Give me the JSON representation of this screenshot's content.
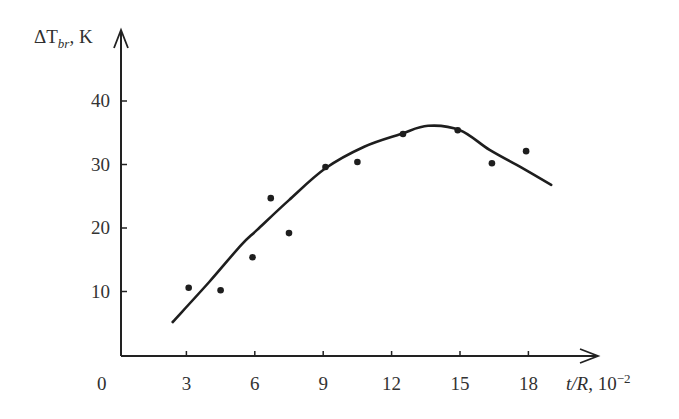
{
  "chart_data": {
    "type": "scatter",
    "title": "",
    "xlabel": "t/R, 10^-2",
    "ylabel": "ΔT_br, K",
    "xlim": [
      0,
      21
    ],
    "ylim": [
      0,
      45
    ],
    "grid": false,
    "legend": null,
    "x_ticks": [
      0,
      3,
      6,
      9,
      12,
      15,
      18
    ],
    "y_ticks": [
      10,
      20,
      30,
      40
    ],
    "series": [
      {
        "name": "measured",
        "kind": "scatter",
        "x": [
          3.1,
          4.5,
          5.9,
          6.7,
          7.5,
          9.1,
          10.5,
          12.5,
          14.9,
          16.4,
          17.9
        ],
        "y": [
          10.6,
          10.2,
          15.4,
          24.7,
          19.2,
          29.6,
          30.4,
          34.8,
          35.4,
          30.2,
          32.1
        ]
      },
      {
        "name": "fit curve",
        "kind": "line",
        "x": [
          2.4,
          4.0,
          5.4,
          6.1,
          7.5,
          9.1,
          10.8,
          12.4,
          13.6,
          15.0,
          16.3,
          17.7,
          19.0
        ],
        "y": [
          5.2,
          11.5,
          17.3,
          19.7,
          24.4,
          29.4,
          32.8,
          34.8,
          36.1,
          35.4,
          32.3,
          29.5,
          26.8
        ]
      }
    ]
  },
  "axes": {
    "y_label_main": "ΔT",
    "y_label_sub": "br",
    "y_label_unit": ", K",
    "x_label_main": "t/R",
    "x_label_unit": ", 10",
    "x_label_exp": "−2",
    "origin_label": "0",
    "x_tick_labels": [
      "3",
      "6",
      "9",
      "12",
      "15",
      "18"
    ],
    "y_tick_labels": [
      "40",
      "30",
      "20",
      "10"
    ]
  }
}
